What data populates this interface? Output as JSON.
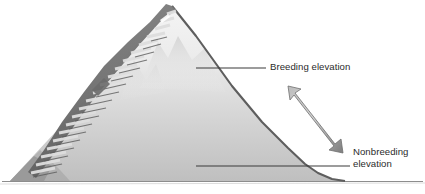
{
  "figure": {
    "type": "illustration",
    "background_color": "#ffffff"
  },
  "labels": {
    "breeding": "Breeding elevation",
    "nonbreeding_line1": "Nonbreeding",
    "nonbreeding_line2": "elevation"
  },
  "colors": {
    "text": "#2b2b2b",
    "leader_line": "#3a3a3a",
    "mountain_outline": "#5a5a5a",
    "mountain_top": "#f2f2f2",
    "mountain_bottom": "#c2c2c2",
    "stair_dark": "#6e6e6e",
    "stair_light": "#d8d8d8",
    "arrow_light": "#c9c9c9",
    "arrow_dark": "#7d7d7d",
    "ground_line": "#8a8a8a"
  },
  "elements": {
    "mountain_peak_label": "mountain-peak",
    "staircase_label": "staircase",
    "arrow_label": "elevation-range-double-arrow",
    "ground_label": "ground-line",
    "breeding_leader_label": "breeding-leader-line",
    "nonbreeding_leader_label": "nonbreeding-leader-line"
  }
}
